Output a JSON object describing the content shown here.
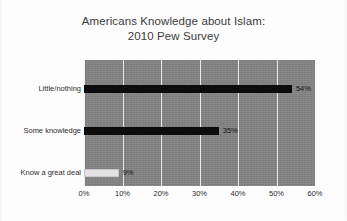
{
  "chart_data": {
    "type": "bar",
    "orientation": "horizontal",
    "title": "Americans Knowledge about Islam:",
    "subtitle": "2010 Pew Survey",
    "title_full": "Americans Knowledge about Islam: 2010 Pew Survey",
    "categories": [
      "Little/nothing",
      "Some knowledge",
      "Know a great deal"
    ],
    "values": [
      54,
      35,
      9
    ],
    "value_labels": [
      "54%",
      "35%",
      "9%"
    ],
    "bar_colors": [
      "#0c0c0c",
      "#0c0c0c",
      "#e2e2e2"
    ],
    "xlabel": "",
    "ylabel": "",
    "xlim": [
      0,
      60
    ],
    "xtick_values": [
      0,
      10,
      20,
      30,
      40,
      50,
      60
    ],
    "xtick_labels": [
      "0%",
      "10%",
      "20%",
      "30%",
      "40%",
      "50%",
      "60%"
    ],
    "grid": "vertical",
    "gridline_color": "#e9e9e9",
    "plot_background": "#848484",
    "figure_background": "#ffffff",
    "legend": "none",
    "units": "percent"
  },
  "figure": {
    "title_line1": "Americans Knowledge about Islam:",
    "title_line2": "2010 Pew Survey"
  }
}
